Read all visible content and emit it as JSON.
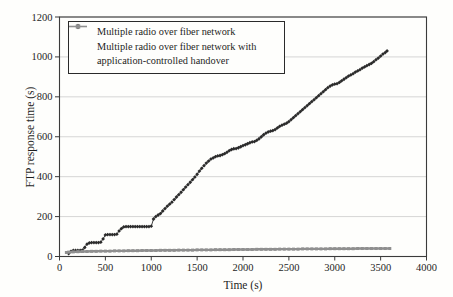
{
  "chart_data": {
    "type": "line",
    "title": "",
    "xlabel": "Time (s)",
    "ylabel": "FTP response time (s)",
    "xlim": [
      0,
      4000
    ],
    "ylim": [
      0,
      1200
    ],
    "xticks": [
      0,
      500,
      1000,
      1500,
      2000,
      2500,
      3000,
      3500,
      4000
    ],
    "xtick_labels": [
      "0",
      "500",
      "1000",
      "1500",
      "2000",
      "2500",
      "3000",
      "3500",
      "4000"
    ],
    "yticks": [
      0,
      200,
      400,
      600,
      800,
      1000,
      1200
    ],
    "ytick_labels": [
      "0",
      "200",
      "400",
      "600",
      "800",
      "1000",
      "1200"
    ],
    "grid": "horizontal-only",
    "legend_position": "top-left",
    "colors": {
      "axis": "#3b3b3b",
      "grid": "#cbcbcb",
      "text": "#1e1e1e",
      "background": "#fefefc"
    },
    "series": [
      {
        "name": "Multiple radio over fiber network",
        "marker": "diamond",
        "color": "#2b2b2b",
        "points": [
          [
            100,
            15
          ],
          [
            125,
            25
          ],
          [
            150,
            30
          ],
          [
            175,
            30
          ],
          [
            200,
            30
          ],
          [
            225,
            30
          ],
          [
            250,
            32
          ],
          [
            275,
            45
          ],
          [
            300,
            62
          ],
          [
            325,
            68
          ],
          [
            350,
            70
          ],
          [
            375,
            70
          ],
          [
            400,
            70
          ],
          [
            425,
            70
          ],
          [
            450,
            72
          ],
          [
            475,
            88
          ],
          [
            500,
            108
          ],
          [
            525,
            110
          ],
          [
            550,
            110
          ],
          [
            575,
            110
          ],
          [
            600,
            110
          ],
          [
            625,
            112
          ],
          [
            650,
            128
          ],
          [
            675,
            140
          ],
          [
            700,
            148
          ],
          [
            725,
            150
          ],
          [
            750,
            150
          ],
          [
            775,
            150
          ],
          [
            800,
            150
          ],
          [
            825,
            150
          ],
          [
            850,
            150
          ],
          [
            875,
            150
          ],
          [
            900,
            150
          ],
          [
            925,
            150
          ],
          [
            950,
            150
          ],
          [
            975,
            150
          ],
          [
            1000,
            152
          ],
          [
            1025,
            188
          ],
          [
            1050,
            200
          ],
          [
            1075,
            208
          ],
          [
            1100,
            215
          ],
          [
            1125,
            228
          ],
          [
            1150,
            240
          ],
          [
            1175,
            252
          ],
          [
            1200,
            262
          ],
          [
            1225,
            272
          ],
          [
            1250,
            285
          ],
          [
            1275,
            298
          ],
          [
            1300,
            310
          ],
          [
            1325,
            322
          ],
          [
            1350,
            335
          ],
          [
            1375,
            348
          ],
          [
            1400,
            360
          ],
          [
            1425,
            372
          ],
          [
            1450,
            385
          ],
          [
            1475,
            398
          ],
          [
            1500,
            412
          ],
          [
            1525,
            428
          ],
          [
            1550,
            442
          ],
          [
            1575,
            455
          ],
          [
            1600,
            468
          ],
          [
            1625,
            478
          ],
          [
            1650,
            488
          ],
          [
            1675,
            494
          ],
          [
            1700,
            500
          ],
          [
            1725,
            504
          ],
          [
            1750,
            506
          ],
          [
            1775,
            510
          ],
          [
            1800,
            515
          ],
          [
            1825,
            522
          ],
          [
            1850,
            530
          ],
          [
            1875,
            536
          ],
          [
            1900,
            540
          ],
          [
            1925,
            541
          ],
          [
            1950,
            545
          ],
          [
            1975,
            550
          ],
          [
            2000,
            556
          ],
          [
            2025,
            560
          ],
          [
            2050,
            565
          ],
          [
            2075,
            570
          ],
          [
            2100,
            574
          ],
          [
            2125,
            576
          ],
          [
            2150,
            582
          ],
          [
            2175,
            590
          ],
          [
            2200,
            600
          ],
          [
            2225,
            610
          ],
          [
            2250,
            618
          ],
          [
            2275,
            624
          ],
          [
            2300,
            628
          ],
          [
            2325,
            631
          ],
          [
            2350,
            636
          ],
          [
            2375,
            644
          ],
          [
            2400,
            652
          ],
          [
            2425,
            658
          ],
          [
            2450,
            663
          ],
          [
            2475,
            668
          ],
          [
            2500,
            676
          ],
          [
            2525,
            686
          ],
          [
            2550,
            696
          ],
          [
            2575,
            706
          ],
          [
            2600,
            716
          ],
          [
            2625,
            726
          ],
          [
            2650,
            736
          ],
          [
            2675,
            746
          ],
          [
            2700,
            756
          ],
          [
            2725,
            766
          ],
          [
            2750,
            776
          ],
          [
            2775,
            786
          ],
          [
            2800,
            796
          ],
          [
            2825,
            806
          ],
          [
            2850,
            816
          ],
          [
            2875,
            826
          ],
          [
            2900,
            836
          ],
          [
            2925,
            846
          ],
          [
            2950,
            854
          ],
          [
            2975,
            860
          ],
          [
            3000,
            864
          ],
          [
            3025,
            866
          ],
          [
            3050,
            872
          ],
          [
            3075,
            880
          ],
          [
            3100,
            888
          ],
          [
            3125,
            896
          ],
          [
            3150,
            904
          ],
          [
            3175,
            910
          ],
          [
            3200,
            916
          ],
          [
            3225,
            924
          ],
          [
            3250,
            930
          ],
          [
            3275,
            936
          ],
          [
            3300,
            944
          ],
          [
            3325,
            950
          ],
          [
            3350,
            956
          ],
          [
            3375,
            962
          ],
          [
            3400,
            968
          ],
          [
            3425,
            976
          ],
          [
            3450,
            986
          ],
          [
            3475,
            994
          ],
          [
            3500,
            1004
          ],
          [
            3525,
            1014
          ],
          [
            3550,
            1022
          ],
          [
            3570,
            1030
          ]
        ]
      },
      {
        "name": "Multiple radio over fiber network with application-controlled handover",
        "marker": "square",
        "color": "#8f8f8f",
        "points": [
          [
            75,
            20
          ],
          [
            100,
            22
          ],
          [
            150,
            23
          ],
          [
            200,
            24
          ],
          [
            250,
            25
          ],
          [
            300,
            25
          ],
          [
            350,
            26
          ],
          [
            400,
            26
          ],
          [
            450,
            27
          ],
          [
            500,
            27
          ],
          [
            550,
            27
          ],
          [
            600,
            28
          ],
          [
            650,
            28
          ],
          [
            700,
            28
          ],
          [
            750,
            29
          ],
          [
            800,
            29
          ],
          [
            850,
            29
          ],
          [
            900,
            30
          ],
          [
            950,
            30
          ],
          [
            1000,
            30
          ],
          [
            1050,
            30
          ],
          [
            1100,
            31
          ],
          [
            1150,
            31
          ],
          [
            1200,
            31
          ],
          [
            1250,
            31
          ],
          [
            1300,
            32
          ],
          [
            1350,
            32
          ],
          [
            1400,
            32
          ],
          [
            1450,
            32
          ],
          [
            1500,
            33
          ],
          [
            1550,
            33
          ],
          [
            1600,
            33
          ],
          [
            1650,
            33
          ],
          [
            1700,
            34
          ],
          [
            1750,
            34
          ],
          [
            1800,
            34
          ],
          [
            1850,
            34
          ],
          [
            1900,
            35
          ],
          [
            1950,
            35
          ],
          [
            2000,
            35
          ],
          [
            2050,
            35
          ],
          [
            2100,
            35
          ],
          [
            2150,
            36
          ],
          [
            2200,
            36
          ],
          [
            2250,
            36
          ],
          [
            2300,
            36
          ],
          [
            2350,
            36
          ],
          [
            2400,
            37
          ],
          [
            2450,
            37
          ],
          [
            2500,
            37
          ],
          [
            2550,
            37
          ],
          [
            2600,
            37
          ],
          [
            2650,
            38
          ],
          [
            2700,
            38
          ],
          [
            2750,
            38
          ],
          [
            2800,
            38
          ],
          [
            2850,
            38
          ],
          [
            2900,
            38
          ],
          [
            2950,
            39
          ],
          [
            3000,
            39
          ],
          [
            3050,
            39
          ],
          [
            3100,
            39
          ],
          [
            3150,
            39
          ],
          [
            3200,
            39
          ],
          [
            3250,
            40
          ],
          [
            3300,
            40
          ],
          [
            3350,
            40
          ],
          [
            3400,
            40
          ],
          [
            3450,
            40
          ],
          [
            3500,
            40
          ],
          [
            3550,
            40
          ],
          [
            3600,
            40
          ]
        ]
      }
    ]
  },
  "legend": {
    "entries": [
      {
        "lines": [
          "Multiple radio over fiber network"
        ]
      },
      {
        "lines": [
          "Multiple radio over fiber network with",
          "application-controlled handover"
        ]
      }
    ]
  }
}
